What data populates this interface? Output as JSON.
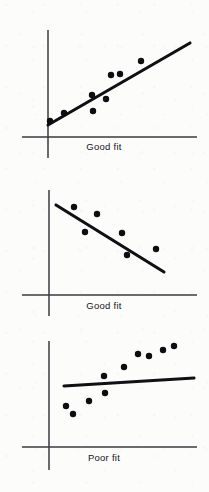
{
  "figure": {
    "background_color": "#fcfcfb",
    "ink_color": "#0d0d11",
    "axis_color": "#3a3a40",
    "width": 209,
    "height": 492,
    "panel_count": 3
  },
  "panels": [
    {
      "id": "panel-1",
      "label": "Good fit",
      "label_x": 104,
      "label_y": 141,
      "relationship": "positive",
      "axes": {
        "y_axis": {
          "x": 48,
          "y_top": 30,
          "y_bottom": 158
        },
        "x_axis": {
          "y": 137,
          "x_left": 22,
          "x_right": 197
        }
      },
      "fit_line": {
        "x1": 48,
        "y1": 125,
        "x2": 190,
        "y2": 43
      },
      "points": [
        {
          "x": 50,
          "y": 121
        },
        {
          "x": 64,
          "y": 113
        },
        {
          "x": 93,
          "y": 111
        },
        {
          "x": 92,
          "y": 95
        },
        {
          "x": 106,
          "y": 99
        },
        {
          "x": 111,
          "y": 75
        },
        {
          "x": 120,
          "y": 74
        },
        {
          "x": 141,
          "y": 61
        }
      ]
    },
    {
      "id": "panel-2",
      "label": "Good fit",
      "label_x": 104,
      "label_y": 300,
      "relationship": "negative",
      "axes": {
        "y_axis": {
          "x": 49,
          "y_top": 190,
          "y_bottom": 316
        },
        "x_axis": {
          "y": 295,
          "x_left": 22,
          "x_right": 197
        }
      },
      "fit_line": {
        "x1": 56,
        "y1": 205,
        "x2": 164,
        "y2": 272
      },
      "points": [
        {
          "x": 74,
          "y": 207
        },
        {
          "x": 97,
          "y": 214
        },
        {
          "x": 85,
          "y": 232
        },
        {
          "x": 122,
          "y": 233
        },
        {
          "x": 127,
          "y": 255
        },
        {
          "x": 156,
          "y": 249
        }
      ]
    },
    {
      "id": "panel-3",
      "label": "Poor fit",
      "label_x": 104,
      "label_y": 452,
      "relationship": "none",
      "axes": {
        "y_axis": {
          "x": 49,
          "y_top": 341,
          "y_bottom": 470
        },
        "x_axis": {
          "y": 447,
          "x_left": 22,
          "x_right": 197
        }
      },
      "fit_line": {
        "x1": 64,
        "y1": 386,
        "x2": 194,
        "y2": 378
      },
      "points": [
        {
          "x": 66,
          "y": 406
        },
        {
          "x": 73,
          "y": 414
        },
        {
          "x": 89,
          "y": 401
        },
        {
          "x": 105,
          "y": 393
        },
        {
          "x": 104,
          "y": 376
        },
        {
          "x": 124,
          "y": 367
        },
        {
          "x": 138,
          "y": 354
        },
        {
          "x": 149,
          "y": 356
        },
        {
          "x": 163,
          "y": 350
        },
        {
          "x": 174,
          "y": 346
        }
      ]
    }
  ],
  "chart_data": {
    "type": "scatter",
    "xlabel": "",
    "ylabel": "",
    "grid": false,
    "legend": "none",
    "subplots": [
      {
        "name": "Good fit (positive slope)",
        "caption": "Good fit",
        "x": [
          0.02,
          0.13,
          0.34,
          0.33,
          0.44,
          0.48,
          0.55,
          0.7
        ],
        "y": [
          0.12,
          0.19,
          0.2,
          0.33,
          0.3,
          0.48,
          0.49,
          0.59
        ],
        "fit": {
          "slope": 0.62,
          "intercept": 0.09,
          "x_range": [
            0.0,
            1.0
          ]
        },
        "xlim": [
          0,
          1
        ],
        "ylim": [
          0,
          1
        ]
      },
      {
        "name": "Good fit (negative slope)",
        "caption": "Good fit",
        "x": [
          0.17,
          0.32,
          0.24,
          0.49,
          0.53,
          0.72
        ],
        "y": [
          0.84,
          0.77,
          0.6,
          0.59,
          0.38,
          0.44
        ],
        "fit": {
          "slope": -0.64,
          "intercept": 0.86,
          "x_range": [
            0.05,
            0.78
          ]
        },
        "xlim": [
          0,
          1
        ],
        "ylim": [
          0,
          1
        ]
      },
      {
        "name": "Poor fit (no relationship)",
        "caption": "Poor fit",
        "x": [
          0.11,
          0.16,
          0.27,
          0.38,
          0.37,
          0.51,
          0.6,
          0.68,
          0.77,
          0.85
        ],
        "y": [
          0.39,
          0.31,
          0.43,
          0.51,
          0.67,
          0.75,
          0.88,
          0.86,
          0.91,
          0.95
        ],
        "fit": {
          "slope": 0.06,
          "intercept": 0.57,
          "x_range": [
            0.1,
            1.0
          ]
        },
        "xlim": [
          0,
          1
        ],
        "ylim": [
          0,
          1
        ]
      }
    ]
  }
}
